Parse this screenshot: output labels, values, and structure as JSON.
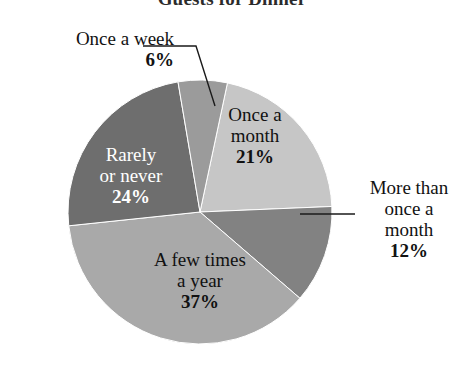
{
  "chart_data": {
    "type": "pie",
    "title": "Guests for Dinner",
    "xlabel": "",
    "ylabel": "",
    "legend_position": "none",
    "grid": false,
    "labels": [
      "Once a month",
      "More than once a month",
      "A few times a year",
      "Rarely or never",
      "Once a week"
    ],
    "values": [
      21,
      12,
      37,
      24,
      6
    ],
    "value_suffix": "%",
    "colors": [
      "#c6c6c6",
      "#828282",
      "#a9a9a9",
      "#6e6e6e",
      "#9b9b9b"
    ],
    "slices": [
      {
        "label": "Once a month",
        "label_line1": "Once a",
        "label_line2": "month",
        "value": 21,
        "percent_text": "21%",
        "color": "#c6c6c6",
        "label_placement": "inside",
        "text_color": "#111111"
      },
      {
        "label": "More than once a month",
        "label_line1": "More than",
        "label_line2": "once a",
        "label_line3": "month",
        "value": 12,
        "percent_text": "12%",
        "color": "#828282",
        "label_placement": "outside-right",
        "text_color": "#121212"
      },
      {
        "label": "A few times a year",
        "label_line1": "A few times",
        "label_line2": "a year",
        "value": 37,
        "percent_text": "37%",
        "color": "#a9a9a9",
        "label_placement": "inside",
        "text_color": "#111111"
      },
      {
        "label": "Rarely or never",
        "label_line1": "Rarely",
        "label_line2": "or never",
        "value": 24,
        "percent_text": "24%",
        "color": "#6e6e6e",
        "label_placement": "inside",
        "text_color": "#ffffff"
      },
      {
        "label": "Once a week",
        "label_line1": "Once a week",
        "value": 6,
        "percent_text": "6%",
        "color": "#9b9b9b",
        "label_placement": "outside-left",
        "text_color": "#121212"
      }
    ]
  },
  "geometry": {
    "center_x": 200,
    "center_y": 212,
    "radius": 132,
    "start_angle_deg": 12
  },
  "leader_lines": {
    "once_a_week": "elbow",
    "more_than_once_a_month": "horizontal"
  }
}
